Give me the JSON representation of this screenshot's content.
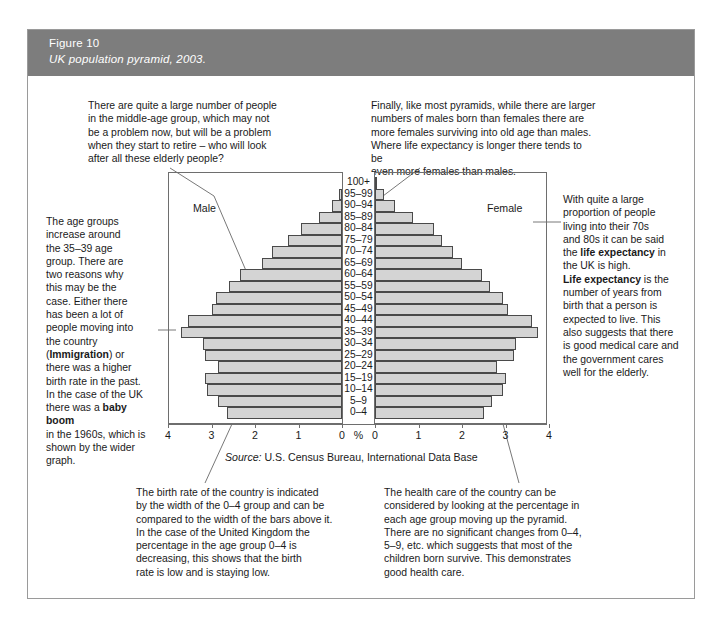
{
  "figure": {
    "number": "Figure 10",
    "caption": "UK population pyramid, 2003.",
    "banner_color": "#7d7d7d",
    "bar_fill": "#d4d4d4",
    "bar_stroke": "#4a4a4a"
  },
  "labels": {
    "male": "Male",
    "female": "Female",
    "percent_symbol": "%"
  },
  "source": {
    "prefix": "Source:",
    "text": "U.S. Census Bureau, International Data Base"
  },
  "annotations": {
    "top_left": "There are quite a large number of people\nin the middle-age group, which may not\nbe a problem now, but will be a problem\nwhen they start to retire – who will look\nafter all these elderly people?",
    "top_right": "Finally, like most pyramids, while there are larger\nnumbers of males born than females there are\nmore females surviving into old age than males.\nWhere life expectancy is longer there tends to be\neven more females than males.",
    "left": "The age groups\nincrease around\nthe 35–39 age\ngroup. There are\ntwo reasons why\nthis may be the\ncase. Either there\nhas been a lot of\npeople moving into\nthe country\n(Immigration) or\nthere was a higher\nbirth rate in the past.\nIn the case of the UK\nthere was a baby boom\nin the 1960s, which is\nshown by the wider\ngraph.",
    "left_bold_terms": [
      "Immigration",
      "baby boom"
    ],
    "right": "With quite a large\nproportion of people\nliving into their 70s\nand 80s it can be said\nthe life expectancy in\nthe UK is high.\nLife expectancy is the\nnumber of years from\nbirth that a person is\nexpected to live. This\nalso suggests that there\nis good medical care and\nthe government cares\nwell for the elderly.",
    "right_bold_terms": [
      "life expectancy",
      "Life expectancy"
    ],
    "bottom_left": "The birth rate of the country is indicated\nby the width of the 0–4 group and can be\ncompared to the width of the bars above it.\nIn the case of the United Kingdom the\npercentage in the age group 0–4 is\ndecreasing, this shows that the birth\nrate is low and is staying low.",
    "bottom_right": "The health care of the country can be\nconsidered by looking at the percentage in\neach age group moving up the pyramid.\nThere are no significant changes from 0–4,\n5–9, etc. which suggests that most of the\nchildren born survive. This demonstrates\ngood health care."
  },
  "chart_data": {
    "type": "bar",
    "title": "UK population pyramid, 2003",
    "subtype": "population-pyramid",
    "xlabel": "%",
    "ylabel": "",
    "xlim": [
      0,
      4
    ],
    "grid": false,
    "legend": [
      "Male",
      "Female"
    ],
    "legend_position": "inside-top",
    "categories": [
      "100+",
      "95–99",
      "90–94",
      "85–89",
      "80–84",
      "75–79",
      "70–74",
      "65–69",
      "60–64",
      "55–59",
      "50–54",
      "45–49",
      "40–44",
      "35–39",
      "30–34",
      "25–29",
      "20–24",
      "15–19",
      "10–14",
      "5–9",
      "0–4"
    ],
    "xticks_left": [
      "4",
      "3",
      "2",
      "1",
      "0"
    ],
    "xticks_right": [
      "0",
      "1",
      "2",
      "3",
      "4"
    ],
    "series": [
      {
        "name": "Male",
        "direction": "left",
        "values": [
          0.01,
          0.07,
          0.23,
          0.53,
          0.95,
          1.25,
          1.6,
          1.85,
          2.35,
          2.6,
          2.9,
          3.0,
          3.55,
          3.7,
          3.2,
          3.15,
          2.85,
          3.15,
          3.1,
          2.85,
          2.65
        ]
      },
      {
        "name": "Female",
        "direction": "right",
        "values": [
          0.04,
          0.2,
          0.47,
          0.87,
          1.35,
          1.55,
          1.8,
          2.0,
          2.45,
          2.65,
          2.95,
          3.05,
          3.6,
          3.75,
          3.25,
          3.2,
          2.8,
          3.0,
          2.95,
          2.7,
          2.5
        ]
      }
    ]
  }
}
